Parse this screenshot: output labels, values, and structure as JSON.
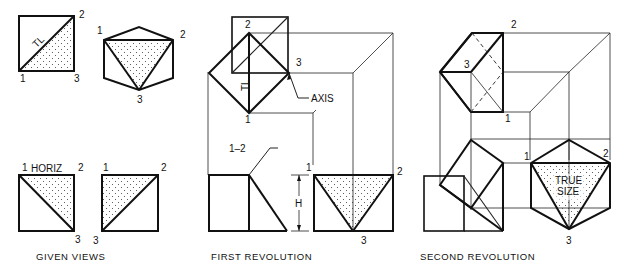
{
  "figure": {
    "captions": {
      "given": "GIVEN VIEWS",
      "first": "FIRST REVOLUTION",
      "second": "SECOND REVOLUTION"
    },
    "given_views": {
      "top_square": {
        "labels": {
          "p1": "1",
          "p2": "2",
          "p3": "3"
        },
        "diagonal_label": "TL"
      },
      "top_hexagon": {
        "labels": {
          "p1": "1",
          "p2": "2",
          "p3": "3"
        }
      },
      "bottom_square_a": {
        "labels": {
          "p1": "1",
          "p2": "2",
          "p3": "3"
        },
        "tag": "HORIZ"
      },
      "bottom_square_b": {
        "labels": {
          "p1": "1",
          "p2": "2",
          "p3": "3"
        }
      }
    },
    "first_revolution": {
      "top": {
        "labels": {
          "p1": "1",
          "p2": "2",
          "p3": "3"
        },
        "tl_label": "TL",
        "axis_label": "AXIS"
      },
      "front": {
        "callout": "1–2",
        "height_label": "H"
      },
      "side": {
        "labels": {
          "p1": "1",
          "p2": "2",
          "p3": "3"
        }
      }
    },
    "second_revolution": {
      "top": {
        "labels": {
          "p1": "1",
          "p2": "2",
          "p3": "3"
        }
      },
      "true_size": {
        "labels": {
          "p1": "1",
          "p2": "2",
          "p3": "3"
        },
        "text_line1": "TRUE",
        "text_line2": "SIZE"
      }
    }
  }
}
